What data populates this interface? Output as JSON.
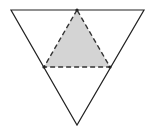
{
  "diagram": {
    "type": "geometry",
    "outer_triangle": {
      "vertices": [
        [
          11,
          10
        ],
        [
          144,
          10
        ],
        [
          77,
          125
        ]
      ],
      "stroke": "#222222",
      "stroke_width": 1.2,
      "fill": "none"
    },
    "inner_triangle": {
      "vertices": [
        [
          77,
          10
        ],
        [
          44,
          67
        ],
        [
          110,
          67
        ]
      ],
      "stroke": "#333333",
      "stroke_width": 1.4,
      "dash": "5,3",
      "fill": "#d4d4d4"
    },
    "points": [
      [
        77,
        10
      ],
      [
        44,
        67
      ],
      [
        110,
        67
      ]
    ],
    "point_color": "#222222"
  }
}
